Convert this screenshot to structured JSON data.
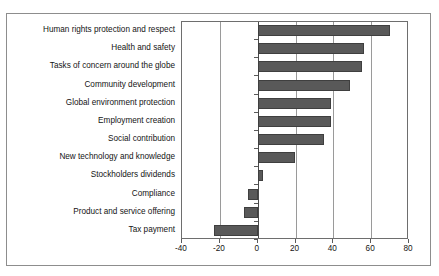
{
  "figure": {
    "caption_faint": "",
    "background_color": "#ffffff",
    "frame_color": "#8d8d8d",
    "bar_color": "#595959",
    "grid_color": "#9a9a9a",
    "zero_axis_color": "#4a4a4a"
  },
  "chart_data": {
    "type": "bar",
    "orientation": "horizontal",
    "title": "",
    "subtitle": "",
    "xlabel": "",
    "ylabel": "",
    "xlim": [
      -40,
      80
    ],
    "ylim": [],
    "grid": true,
    "legend": false,
    "legend_position": "none",
    "xticks": [
      -40,
      -20,
      0,
      20,
      40,
      60,
      80
    ],
    "xtick_labels": [
      "-40",
      "-20",
      "0",
      "20",
      "40",
      "60",
      "80"
    ],
    "categories": [
      "Human rights protection and respect",
      "Health and safety",
      "Tasks of concern around the globe",
      "Community development",
      "Global environment protection",
      "Employment creation",
      "Social contribution",
      "New technology and knowledge",
      "Stockholders dividends",
      "Compliance",
      "Product and service offering",
      "Tax payment"
    ],
    "values": [
      70,
      56,
      55,
      49,
      39,
      39,
      35,
      20,
      3,
      -5,
      -7,
      -23
    ],
    "series": [
      {
        "name": "",
        "values": [
          70,
          56,
          55,
          49,
          39,
          39,
          35,
          20,
          3,
          -5,
          -7,
          -23
        ]
      }
    ]
  }
}
